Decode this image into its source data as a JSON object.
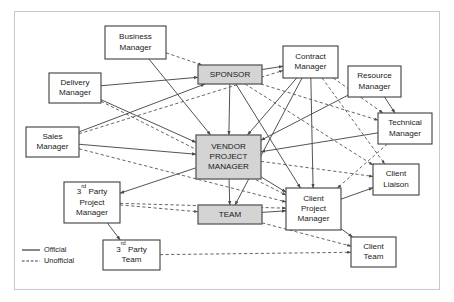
{
  "diagram": {
    "canvas": {
      "width": 454,
      "height": 302
    },
    "frame": {
      "x": 14,
      "y": 11,
      "width": 426,
      "height": 279
    },
    "colors": {
      "background": "#ffffff",
      "node_fill": "#ffffff",
      "node_highlight_fill": "#d4d4d4",
      "node_stroke": "#3f3f3f",
      "edge_stroke": "#4a4a4a",
      "frame_stroke": "#c8c8c8",
      "text": "#1a1a1a"
    },
    "nodes": [
      {
        "id": "business-manager",
        "label": "Business Manager",
        "lines": [
          "Business",
          "Manager"
        ],
        "x": 105,
        "y": 26,
        "w": 61,
        "h": 33,
        "style": "plain"
      },
      {
        "id": "delivery-manager",
        "label": "Delivery Manager",
        "lines": [
          "Delivery",
          "Manager"
        ],
        "x": 49,
        "y": 73,
        "w": 52,
        "h": 30,
        "style": "plain"
      },
      {
        "id": "sales-manager",
        "label": "Sales Manager",
        "lines": [
          "Sales",
          "Manager"
        ],
        "x": 26,
        "y": 127,
        "w": 53,
        "h": 30,
        "style": "plain"
      },
      {
        "id": "sponsor",
        "label": "SPONSOR",
        "lines": [
          "SPONSOR"
        ],
        "x": 198,
        "y": 65,
        "w": 64,
        "h": 19,
        "style": "highlight"
      },
      {
        "id": "contract-manager",
        "label": "Contract Manager",
        "lines": [
          "Contract",
          "Manager"
        ],
        "x": 283,
        "y": 46,
        "w": 55,
        "h": 32,
        "style": "plain"
      },
      {
        "id": "resource-manager",
        "label": "Resource Manager",
        "lines": [
          "Resource",
          "Manager"
        ],
        "x": 348,
        "y": 66,
        "w": 53,
        "h": 31,
        "style": "plain"
      },
      {
        "id": "technical-manager",
        "label": "Technical Manager",
        "lines": [
          "Technical",
          "Manager"
        ],
        "x": 378,
        "y": 113,
        "w": 54,
        "h": 31,
        "style": "plain"
      },
      {
        "id": "vendor-project-manager",
        "label": "VENDOR PROJECT MANAGER",
        "lines": [
          "VENDOR",
          "PROJECT",
          "MANAGER"
        ],
        "x": 196,
        "y": 135,
        "w": 65,
        "h": 44,
        "style": "highlight"
      },
      {
        "id": "client-liaison",
        "label": "Client Liaison",
        "lines": [
          "Client",
          "Liaison"
        ],
        "x": 373,
        "y": 164,
        "w": 46,
        "h": 31,
        "style": "plain"
      },
      {
        "id": "third-party-project-manager",
        "label": "3rd Party Project Manager",
        "lines": [
          "3rd Party",
          "Project",
          "Manager"
        ],
        "superscript": "rd",
        "x": 64,
        "y": 182,
        "w": 56,
        "h": 41,
        "style": "plain"
      },
      {
        "id": "team",
        "label": "TEAM",
        "lines": [
          "TEAM"
        ],
        "x": 198,
        "y": 205,
        "w": 64,
        "h": 19,
        "style": "highlight"
      },
      {
        "id": "client-project-manager",
        "label": "Client Project Manager",
        "lines": [
          "Client",
          "Project",
          "Manager"
        ],
        "x": 286,
        "y": 188,
        "w": 55,
        "h": 42,
        "style": "plain"
      },
      {
        "id": "third-party-team",
        "label": "3rd Party Team",
        "lines": [
          "3rd Party",
          "Team"
        ],
        "superscript": "rd",
        "x": 103,
        "y": 240,
        "w": 57,
        "h": 30,
        "style": "plain"
      },
      {
        "id": "client-team",
        "label": "Client Team",
        "lines": [
          "Client",
          "Team"
        ],
        "x": 351,
        "y": 237,
        "w": 45,
        "h": 30,
        "style": "plain"
      }
    ],
    "edges": [
      {
        "from": "business-manager",
        "to": "sponsor",
        "type": "unofficial",
        "arrow": true
      },
      {
        "from": "business-manager",
        "to": "vendor-project-manager",
        "type": "official",
        "arrow": true
      },
      {
        "from": "delivery-manager",
        "to": "sponsor",
        "type": "official",
        "arrow": true
      },
      {
        "from": "delivery-manager",
        "to": "vendor-project-manager",
        "type": "official",
        "arrow": true
      },
      {
        "from": "delivery-manager",
        "to": "client-project-manager",
        "type": "unofficial",
        "arrow": true
      },
      {
        "from": "sales-manager",
        "to": "sponsor",
        "type": "official",
        "arrow": true
      },
      {
        "from": "sales-manager",
        "to": "vendor-project-manager",
        "type": "official",
        "arrow": true
      },
      {
        "from": "sales-manager",
        "to": "contract-manager",
        "type": "unofficial",
        "arrow": true
      },
      {
        "from": "sales-manager",
        "to": "client-project-manager",
        "type": "unofficial",
        "arrow": true
      },
      {
        "from": "sponsor",
        "to": "contract-manager",
        "type": "official",
        "arrow": true
      },
      {
        "from": "sponsor",
        "to": "vendor-project-manager",
        "type": "official",
        "arrow": true
      },
      {
        "from": "sponsor",
        "to": "client-project-manager",
        "type": "official",
        "arrow": true
      },
      {
        "from": "sponsor",
        "to": "technical-manager",
        "type": "unofficial",
        "arrow": true
      },
      {
        "from": "sponsor",
        "to": "client-liaison",
        "type": "unofficial",
        "arrow": true
      },
      {
        "from": "contract-manager",
        "to": "vendor-project-manager",
        "type": "official",
        "arrow": true
      },
      {
        "from": "contract-manager",
        "to": "client-project-manager",
        "type": "official",
        "arrow": true
      },
      {
        "from": "contract-manager",
        "to": "technical-manager",
        "type": "unofficial",
        "arrow": true
      },
      {
        "from": "contract-manager",
        "to": "client-liaison",
        "type": "unofficial",
        "arrow": true
      },
      {
        "from": "contract-manager",
        "to": "team",
        "type": "official",
        "arrow": true
      },
      {
        "from": "resource-manager",
        "to": "vendor-project-manager",
        "type": "official",
        "arrow": true
      },
      {
        "from": "resource-manager",
        "to": "technical-manager",
        "type": "official",
        "arrow": true
      },
      {
        "from": "technical-manager",
        "to": "vendor-project-manager",
        "type": "official",
        "arrow": true
      },
      {
        "from": "technical-manager",
        "to": "client-project-manager",
        "type": "unofficial",
        "arrow": true
      },
      {
        "from": "vendor-project-manager",
        "to": "client-project-manager",
        "type": "official",
        "arrow": true
      },
      {
        "from": "vendor-project-manager",
        "to": "client-liaison",
        "type": "unofficial",
        "arrow": true
      },
      {
        "from": "vendor-project-manager",
        "to": "team",
        "type": "official",
        "arrow": true
      },
      {
        "from": "vendor-project-manager",
        "to": "third-party-project-manager",
        "type": "official",
        "arrow": true
      },
      {
        "from": "third-party-project-manager",
        "to": "team",
        "type": "unofficial",
        "arrow": true
      },
      {
        "from": "third-party-project-manager",
        "to": "third-party-team",
        "type": "official",
        "arrow": true
      },
      {
        "from": "third-party-project-manager",
        "to": "client-project-manager",
        "type": "unofficial",
        "arrow": true
      },
      {
        "from": "team",
        "to": "client-project-manager",
        "type": "official",
        "arrow": true
      },
      {
        "from": "team",
        "to": "client-team",
        "type": "unofficial",
        "arrow": true
      },
      {
        "from": "client-project-manager",
        "to": "client-liaison",
        "type": "official",
        "arrow": true
      },
      {
        "from": "client-project-manager",
        "to": "client-team",
        "type": "official",
        "arrow": true
      },
      {
        "from": "third-party-team",
        "to": "client-team",
        "type": "unofficial",
        "arrow": true
      }
    ],
    "legend": {
      "x": 22,
      "y": 250,
      "items": [
        {
          "id": "legend-official",
          "label": "Official",
          "type": "official"
        },
        {
          "id": "legend-unofficial",
          "label": "Unofficial",
          "type": "unofficial"
        }
      ]
    }
  }
}
